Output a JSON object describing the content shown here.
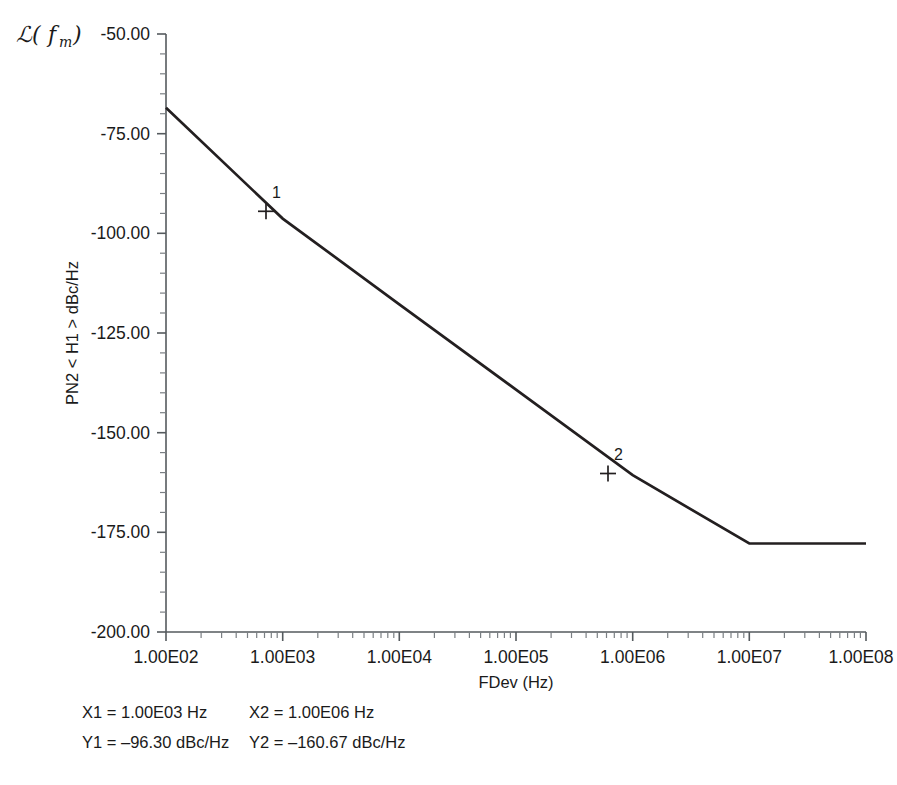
{
  "title": {
    "script_l": "ℒ(",
    "f_symbol": "f",
    "subscript": "m",
    "close": ")",
    "full": "ℒ(fm)"
  },
  "axes": {
    "y_label": "PN2 < H1 > dBc/Hz",
    "x_label": "FDev (Hz)",
    "y_ticks": [
      "-50.00",
      "-75.00",
      "-100.00",
      "-125.00",
      "-150.00",
      "-175.00",
      "-200.00"
    ],
    "x_ticks": [
      "1.00E02",
      "1.00E03",
      "1.00E04",
      "1.00E05",
      "1.00E06",
      "1.00E07",
      "1.00E08"
    ]
  },
  "markers": [
    {
      "name": "1",
      "x_label": "1.00E03",
      "y_label": "-96.30"
    },
    {
      "name": "2",
      "x_label": "1.00E06",
      "y_label": "-160.67"
    }
  ],
  "readout": {
    "x1": "X1 = 1.00E03 Hz",
    "x2": "X2 = 1.00E06 Hz",
    "y1": "Y1 = –96.30 dBc/Hz",
    "y2": "Y2 = –160.67 dBc/Hz"
  },
  "colors": {
    "curve": "#231f20",
    "axis": "#555a5e",
    "background": "#ffffff"
  },
  "chart_data": {
    "type": "line",
    "xlabel": "FDev (Hz)",
    "ylabel": "PN2 < H1 > dBc/Hz",
    "xscale": "log",
    "xlim": [
      100,
      100000000
    ],
    "ylim": [
      -200,
      -50
    ],
    "grid": false,
    "legend": null,
    "x_tick_values": [
      100,
      1000,
      10000,
      100000,
      1000000,
      10000000,
      100000000
    ],
    "x_tick_labels": [
      "1.00E02",
      "1.00E03",
      "1.00E04",
      "1.00E05",
      "1.00E06",
      "1.00E07",
      "1.00E08"
    ],
    "y_tick_values": [
      -50,
      -75,
      -100,
      -125,
      -150,
      -175,
      -200
    ],
    "y_tick_labels": [
      "-50.00",
      "-75.00",
      "-100.00",
      "-125.00",
      "-150.00",
      "-175.00",
      "-200.00"
    ],
    "series": [
      {
        "name": "PN2 <H1>",
        "x": [
          100,
          1000,
          10000,
          100000,
          1000000,
          10000000,
          100000000
        ],
        "y": [
          -68.5,
          -96.3,
          -117.8,
          -139.2,
          -160.67,
          -177.8,
          -177.8
        ]
      }
    ],
    "annotations": [
      {
        "label": "1",
        "x": 1000,
        "y": -96.3
      },
      {
        "label": "2",
        "x": 1000000,
        "y": -160.67
      }
    ]
  }
}
